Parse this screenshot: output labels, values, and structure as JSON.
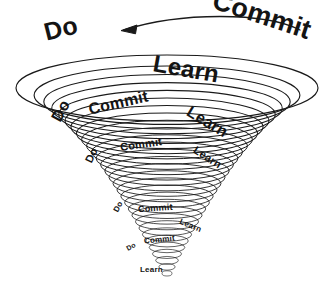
{
  "diagram": {
    "type": "spiral-funnel",
    "background_color": "#ffffff",
    "stroke_color": "#1a1a1a",
    "text_color": "#141414",
    "direction_arrow": {
      "name": "counterclockwise-arrow",
      "points": "left",
      "description": "curved arrow above the funnel pointing left"
    },
    "cycle_labels": [
      "Do",
      "Commit",
      "Learn"
    ],
    "rings": [
      {
        "level": 1,
        "labels": [
          {
            "text": "Do",
            "x": 44,
            "y": 16,
            "size": 25,
            "rot": -14,
            "weight": 900
          },
          {
            "text": "Commit",
            "x": 211,
            "y": 2,
            "size": 27,
            "rot": 18,
            "weight": 900
          },
          {
            "text": "Learn",
            "x": 153,
            "y": 57,
            "size": 24,
            "rot": 10,
            "weight": 900
          }
        ]
      },
      {
        "level": 2,
        "labels": [
          {
            "text": "Do",
            "x": 50,
            "y": 103,
            "size": 16,
            "rot": -62,
            "weight": 800
          },
          {
            "text": "Commit",
            "x": 88,
            "y": 95,
            "size": 16,
            "rot": -13,
            "weight": 800
          },
          {
            "text": "Learn",
            "x": 185,
            "y": 114,
            "size": 16,
            "rot": 31,
            "weight": 800
          }
        ]
      },
      {
        "level": 3,
        "labels": [
          {
            "text": "Do",
            "x": 84,
            "y": 150,
            "size": 11,
            "rot": -64,
            "weight": 800
          },
          {
            "text": "Commit",
            "x": 120,
            "y": 139,
            "size": 11,
            "rot": -8,
            "weight": 800
          },
          {
            "text": "Learn",
            "x": 192,
            "y": 152,
            "size": 11,
            "rot": 33,
            "weight": 800
          }
        ]
      },
      {
        "level": 4,
        "labels": [
          {
            "text": "Do",
            "x": 113,
            "y": 203,
            "size": 8,
            "rot": -62,
            "weight": 800
          },
          {
            "text": "Commit",
            "x": 138,
            "y": 204,
            "size": 9,
            "rot": -4,
            "weight": 800
          },
          {
            "text": "Learn",
            "x": 179,
            "y": 222,
            "size": 8,
            "rot": 22,
            "weight": 800
          }
        ]
      },
      {
        "level": 5,
        "labels": [
          {
            "text": "Do",
            "x": 126,
            "y": 243,
            "size": 7,
            "rot": -30,
            "weight": 800
          },
          {
            "text": "Commit",
            "x": 144,
            "y": 236,
            "size": 8,
            "rot": -6,
            "weight": 800
          },
          {
            "text": "Learn",
            "x": 140,
            "y": 266,
            "size": 8,
            "rot": 0,
            "weight": 800
          }
        ]
      }
    ],
    "geometry": {
      "center_x": 167,
      "top_y": 88,
      "bottom_y": 276,
      "outer_rx": 151,
      "outer_ry": 33,
      "ring_count": 30
    }
  }
}
